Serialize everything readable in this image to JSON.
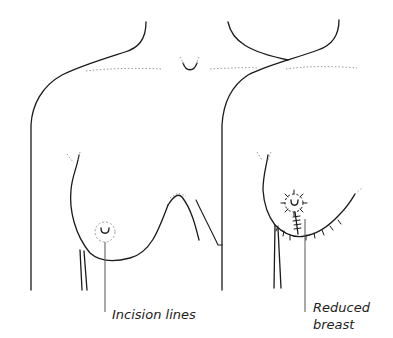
{
  "diagram": {
    "panels": [
      {
        "id": "before",
        "description": "Torso with full breast and dashed incision line around areola"
      },
      {
        "id": "after",
        "description": "Torso with reduced breast showing sutured incisions around areola, vertical and inframammary"
      }
    ],
    "labels": {
      "incision_lines": "Incision lines",
      "reduced_breast_line1": "Reduced",
      "reduced_breast_line2": "breast"
    },
    "colors": {
      "line": "#1a1a1a",
      "dotted": "#9a9a9a",
      "leader": "#555555",
      "background": "#ffffff"
    }
  }
}
